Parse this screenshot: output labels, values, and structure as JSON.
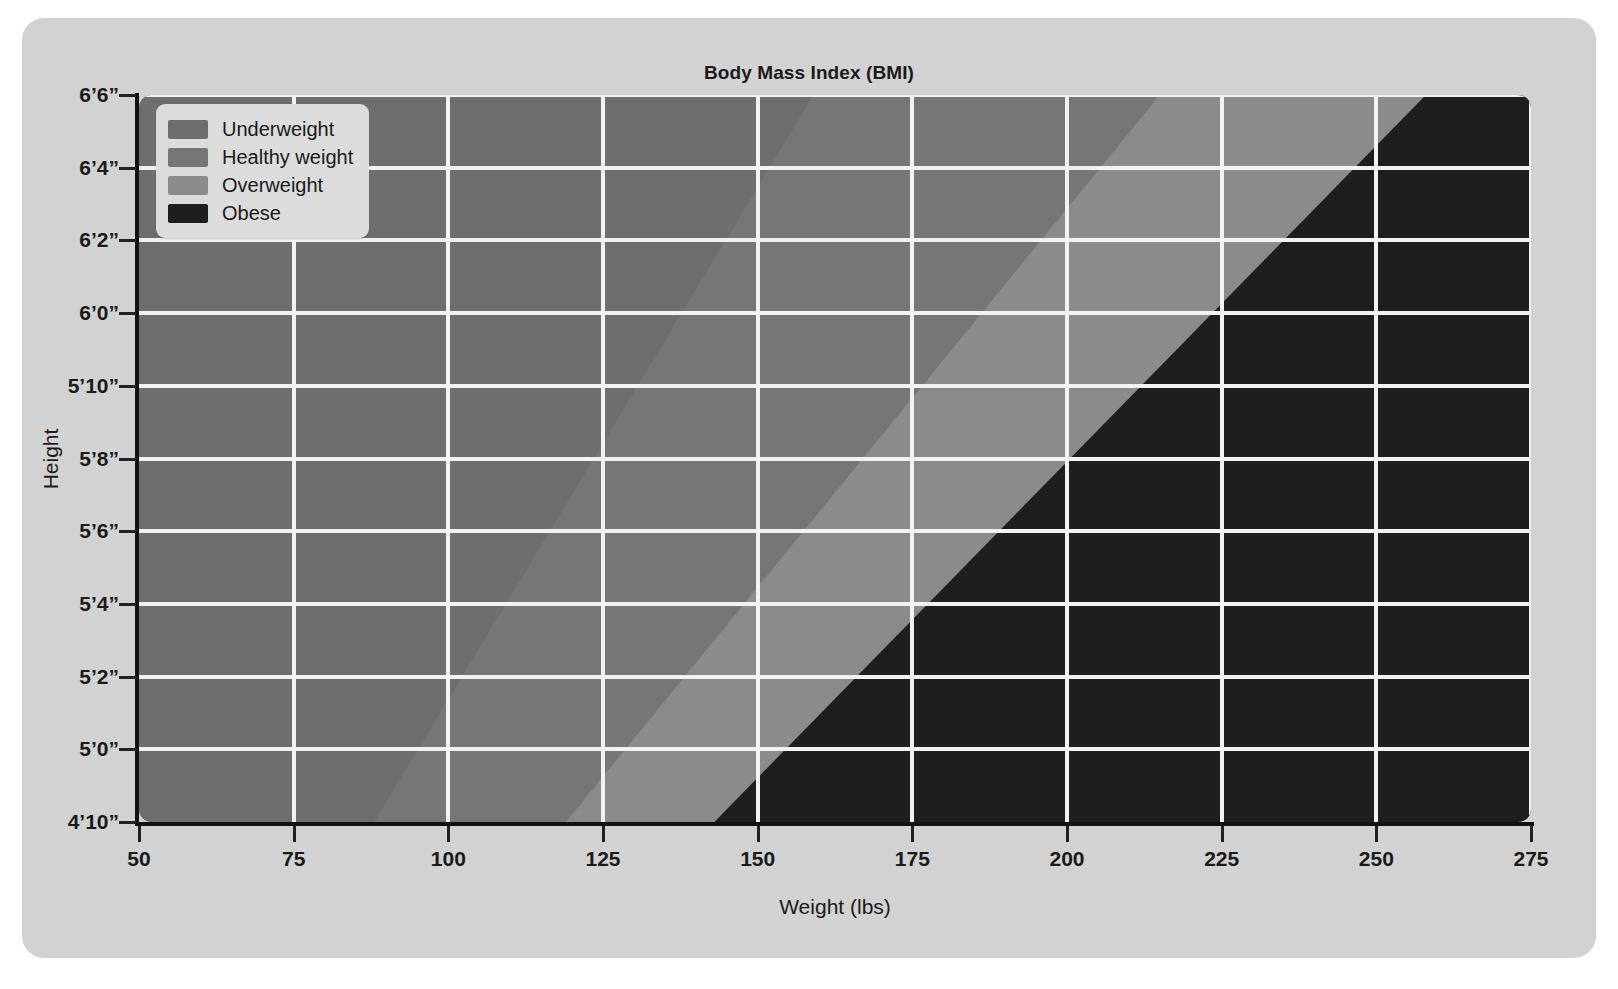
{
  "chart_data": {
    "type": "heatmap",
    "title": "Body Mass Index (BMI)",
    "xlabel": "Weight (lbs)",
    "ylabel": "Height",
    "grid": true,
    "legend_position": "upper-left",
    "xlim": [
      50,
      275
    ],
    "ylim": [
      58,
      78
    ],
    "xticks": [
      50,
      75,
      100,
      125,
      150,
      175,
      200,
      225,
      250,
      275
    ],
    "xtick_labels": [
      "50",
      "75",
      "100",
      "125",
      "150",
      "175",
      "200",
      "225",
      "250",
      "275"
    ],
    "yticks": [
      58,
      60,
      62,
      64,
      66,
      68,
      70,
      72,
      74,
      76,
      78
    ],
    "ytick_labels": [
      "4’10”",
      "5’0”",
      "5’2”",
      "5’4”",
      "5’6”",
      "5’8”",
      "5’10”",
      "6’0”",
      "6’2”",
      "6’4”",
      "6’6”"
    ],
    "categories": [
      "Underweight",
      "Healthy weight",
      "Overweight",
      "Obese"
    ],
    "bands": [
      {
        "name": "Underweight",
        "bmi_range": [
          0,
          18.5
        ],
        "color": "#6e6e6e",
        "boundary_weight_at_4ft10": 88,
        "boundary_weight_at_6ft6": 159
      },
      {
        "name": "Healthy weight",
        "bmi_range": [
          18.5,
          25
        ],
        "color": "#767676",
        "boundary_weight_at_4ft10": 119,
        "boundary_weight_at_6ft6": 215
      },
      {
        "name": "Overweight",
        "bmi_range": [
          25,
          30
        ],
        "color": "#8b8b8b",
        "boundary_weight_at_4ft10": 143,
        "boundary_weight_at_6ft6": 258
      },
      {
        "name": "Obese",
        "bmi_range": [
          30,
          100
        ],
        "color": "#1e1e1e",
        "boundary_weight_at_4ft10": 143,
        "boundary_weight_at_6ft6": 258
      }
    ]
  },
  "chart": {
    "title": "Body Mass Index (BMI)",
    "xaxis_title": "Weight (lbs)",
    "yaxis_title": "Height"
  },
  "axes": {
    "x_tick_labels": [
      "50",
      "75",
      "100",
      "125",
      "150",
      "175",
      "200",
      "225",
      "250",
      "275"
    ],
    "y_tick_labels": [
      "4’10”",
      "5’0”",
      "5’2”",
      "5’4”",
      "5’6”",
      "5’8”",
      "5’10”",
      "6’0”",
      "6’2”",
      "6’4”",
      "6’6”"
    ]
  },
  "legend": {
    "items": [
      {
        "label": "Underweight",
        "color": "#6e6e6e"
      },
      {
        "label": "Healthy weight",
        "color": "#767676"
      },
      {
        "label": "Overweight",
        "color": "#8b8b8b"
      },
      {
        "label": "Obese",
        "color": "#1e1e1e"
      }
    ]
  },
  "theme": {
    "page_background": "#ffffff",
    "card_background": "#d2d2d2",
    "gridline_color": "#f2f2f2",
    "axis_color": "#111111",
    "text_color": "#1a1a1a",
    "legend_background": "#dcdcdc"
  }
}
